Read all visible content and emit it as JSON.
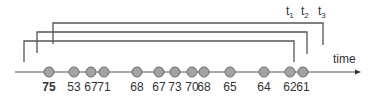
{
  "diagram": {
    "axis_label": "time",
    "points": [
      {
        "value": "75",
        "bold": true
      },
      {
        "value": "53",
        "bold": false
      },
      {
        "value": "67",
        "bold": false
      },
      {
        "value": "71",
        "bold": false
      },
      {
        "value": "68",
        "bold": false
      },
      {
        "value": "67",
        "bold": false
      },
      {
        "value": "73",
        "bold": false
      },
      {
        "value": "70",
        "bold": false
      },
      {
        "value": "68",
        "bold": false
      },
      {
        "value": "65",
        "bold": false
      },
      {
        "value": "64",
        "bold": false
      },
      {
        "value": "62",
        "bold": false
      },
      {
        "value": "61",
        "bold": false
      }
    ],
    "windows": [
      {
        "name": "t",
        "sub": "1",
        "start_index": 0,
        "end_index": 11
      },
      {
        "name": "t",
        "sub": "2",
        "start_index": 0,
        "end_index": 12
      },
      {
        "name": "t",
        "sub": "3",
        "start_index": 0,
        "end_index": 12
      }
    ]
  }
}
